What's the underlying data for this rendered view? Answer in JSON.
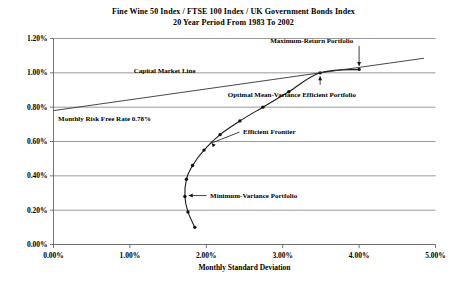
{
  "chart_data": {
    "type": "line",
    "title": "Fine Wine 50 Index / FTSE 100 Index / UK Government Bonds Index",
    "subtitle": "20 Year Period From 1983 To 2002",
    "xlabel": "Monthly Standard Deviation",
    "ylabel": "",
    "xlim": [
      0.0,
      5.0
    ],
    "ylim": [
      0.0,
      1.2
    ],
    "xticks": [
      "0.00%",
      "1.00%",
      "2.00%",
      "3.00%",
      "4.00%",
      "5.00%"
    ],
    "xtick_values": [
      0.0,
      1.0,
      2.0,
      3.0,
      4.0,
      5.0
    ],
    "yticks": [
      "0.00%",
      "0.20%",
      "0.40%",
      "0.60%",
      "0.80%",
      "1.00%",
      "1.20%"
    ],
    "ytick_values": [
      0.0,
      0.2,
      0.4,
      0.6,
      0.8,
      1.0,
      1.2
    ],
    "grid": true,
    "legend": "none",
    "series": [
      {
        "name": "Efficient Frontier",
        "type": "line",
        "markers": true,
        "points": [
          {
            "x": 1.85,
            "y": 0.1
          },
          {
            "x": 1.76,
            "y": 0.19
          },
          {
            "x": 1.72,
            "y": 0.28
          },
          {
            "x": 1.74,
            "y": 0.38
          },
          {
            "x": 1.82,
            "y": 0.46
          },
          {
            "x": 1.97,
            "y": 0.55
          },
          {
            "x": 2.18,
            "y": 0.64
          },
          {
            "x": 2.44,
            "y": 0.72
          },
          {
            "x": 2.74,
            "y": 0.8
          },
          {
            "x": 3.08,
            "y": 0.89
          },
          {
            "x": 3.49,
            "y": 1.0
          },
          {
            "x": 4.0,
            "y": 1.02
          }
        ]
      },
      {
        "name": "Capital Market Line",
        "type": "line",
        "markers": false,
        "points": [
          {
            "x": 0.0,
            "y": 0.78
          },
          {
            "x": 3.49,
            "y": 1.0
          },
          {
            "x": 4.85,
            "y": 1.085
          }
        ]
      }
    ],
    "annotations": [
      {
        "name": "capital-market-line",
        "text": "Capital Market Line",
        "x": 1.05,
        "y": 1.015
      },
      {
        "name": "monthly-risk-free-rate",
        "text": "Monthly Risk Free Rate 0.78%",
        "x": 0.06,
        "y": 0.735
      },
      {
        "name": "maximum-return-portfolio",
        "text": "Maximum-Return Portfolio",
        "x": 3.38,
        "y": 1.185,
        "arrow": "down",
        "target": {
          "x": 4.0,
          "y": 1.02
        }
      },
      {
        "name": "optimal-mean-variance-efficient-portfolio",
        "text": "Optimal Mean-Variance Efficient Portfolio",
        "x": 3.12,
        "y": 0.875,
        "arrow": "up",
        "target": {
          "x": 3.49,
          "y": 1.0
        }
      },
      {
        "name": "efficient-frontier",
        "text": "Efficient Frontier",
        "x": 2.48,
        "y": 0.655,
        "arrow": "up-left",
        "target": {
          "x": 2.2,
          "y": 0.655
        }
      },
      {
        "name": "minimum-variance-portfolio",
        "text": "Minimum-Variance Portfolio",
        "x": 2.05,
        "y": 0.285,
        "arrow": "left",
        "target": {
          "x": 1.73,
          "y": 0.285
        }
      }
    ]
  }
}
